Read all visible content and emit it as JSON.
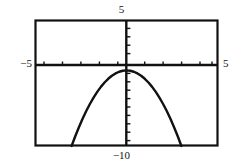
{
  "figure": {
    "kind": "graphing-calculator-screen"
  },
  "labels": {
    "top": "5",
    "bottom": "−10",
    "left": "−5",
    "right": "5"
  },
  "colors": {
    "frame": "#111111",
    "axis": "#111111",
    "curve": "#111111",
    "background": "#ffffff"
  },
  "chart_data": {
    "type": "line",
    "title": "",
    "xlabel": "",
    "ylabel": "",
    "xlim": [
      -5,
      5
    ],
    "ylim": [
      -10,
      5
    ],
    "xscl": 1,
    "yscl": 1,
    "grid": false,
    "legend": "none",
    "axes_visible": true,
    "tick_marks": {
      "x_ticks": [
        -5,
        -4,
        -3,
        -2,
        -1,
        0,
        1,
        2,
        3,
        4,
        5
      ],
      "y_ticks": [
        -10,
        -9,
        -8,
        -7,
        -6,
        -5,
        -4,
        -3,
        -2,
        -1,
        0,
        1,
        2,
        3,
        4,
        5
      ]
    },
    "series": [
      {
        "name": "parabola",
        "shape": "downward-parabola",
        "vertex": [
          0,
          -1
        ],
        "leading_coefficient": -1,
        "x": [
          -3.0,
          -2.8,
          -2.6,
          -2.4,
          -2.2,
          -2.0,
          -1.8,
          -1.6,
          -1.4,
          -1.2,
          -1.0,
          -0.8,
          -0.6,
          -0.4,
          -0.2,
          0.0,
          0.2,
          0.4,
          0.6,
          0.8,
          1.0,
          1.2,
          1.4,
          1.6,
          1.8,
          2.0,
          2.2,
          2.4,
          2.6,
          2.8,
          3.0
        ],
        "values": [
          -10.0,
          -8.84,
          -7.76,
          -6.76,
          -5.84,
          -5.0,
          -4.24,
          -3.56,
          -2.96,
          -2.44,
          -2.0,
          -1.64,
          -1.36,
          -1.16,
          -1.04,
          -1.0,
          -1.04,
          -1.16,
          -1.36,
          -1.64,
          -2.0,
          -2.44,
          -2.96,
          -3.56,
          -4.24,
          -5.0,
          -5.84,
          -6.76,
          -7.76,
          -8.84,
          -10.0
        ]
      }
    ],
    "annotations": [
      {
        "text": "5",
        "position": "top-center",
        "refers_to": "Ymax"
      },
      {
        "text": "−10",
        "position": "bottom-center",
        "refers_to": "Ymin"
      },
      {
        "text": "−5",
        "position": "left-of-x-axis",
        "refers_to": "Xmin"
      },
      {
        "text": "5",
        "position": "right-of-x-axis",
        "refers_to": "Xmax"
      }
    ]
  }
}
